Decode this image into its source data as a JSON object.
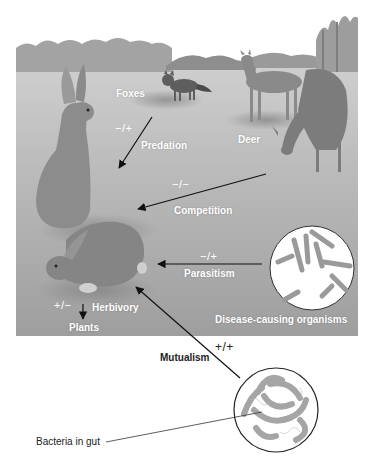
{
  "figure": {
    "organisms": {
      "foxes": "Foxes",
      "deer": "Deer",
      "plants": "Plants",
      "disease": "Disease-causing organisms",
      "bacteria": "Bacteria in gut"
    },
    "interactions": [
      {
        "name": "Predation",
        "symbol": "−/+"
      },
      {
        "name": "Competition",
        "symbol": "−/−"
      },
      {
        "name": "Parasitism",
        "symbol": "−/+"
      },
      {
        "name": "Herbivory",
        "symbol": "+/−"
      },
      {
        "name": "Mutualism",
        "symbol": "+/+"
      }
    ]
  },
  "colors": {
    "sky": "#ffffff",
    "field": "#b4b4b4",
    "field_dark": "#8c8c8c",
    "trees": "#9a9a9a",
    "animal": "#7a7a7a",
    "arrow": "#111111",
    "label": "#ffffff"
  }
}
